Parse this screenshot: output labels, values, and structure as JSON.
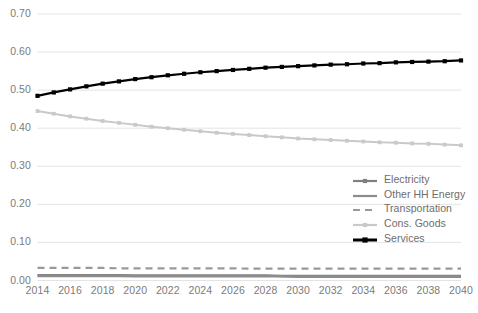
{
  "chart_data": {
    "type": "line",
    "title": "",
    "xlabel": "",
    "ylabel": "",
    "x": [
      2014,
      2015,
      2016,
      2017,
      2018,
      2019,
      2020,
      2021,
      2022,
      2023,
      2024,
      2025,
      2026,
      2027,
      2028,
      2029,
      2030,
      2031,
      2032,
      2033,
      2034,
      2035,
      2036,
      2037,
      2038,
      2039,
      2040
    ],
    "xlim": [
      2014,
      2040
    ],
    "ylim": [
      0.0,
      0.7
    ],
    "yticks": [
      0.0,
      0.1,
      0.2,
      0.3,
      0.4,
      0.5,
      0.6,
      0.7
    ],
    "ytick_labels": [
      "0.00",
      "0.10",
      "0.20",
      "0.30",
      "0.40",
      "0.50",
      "0.60",
      "0.70"
    ],
    "xticks": [
      2014,
      2016,
      2018,
      2020,
      2022,
      2024,
      2026,
      2028,
      2030,
      2032,
      2034,
      2036,
      2038,
      2040
    ],
    "xtick_labels": [
      "2014",
      "2016",
      "2018",
      "2020",
      "2022",
      "2024",
      "2026",
      "2028",
      "2030",
      "2032",
      "2034",
      "2036",
      "2038",
      "2040"
    ],
    "grid": "horizontal",
    "legend_position": "inside-right",
    "series": [
      {
        "name": "Electricity",
        "color": "#808080",
        "style": "solid-marker",
        "values": [
          0.014,
          0.014,
          0.014,
          0.014,
          0.014,
          0.014,
          0.013,
          0.013,
          0.013,
          0.013,
          0.013,
          0.013,
          0.013,
          0.013,
          0.013,
          0.012,
          0.012,
          0.012,
          0.012,
          0.012,
          0.012,
          0.012,
          0.012,
          0.012,
          0.012,
          0.012,
          0.012
        ]
      },
      {
        "name": "Other HH Energy",
        "color": "#8c8c8c",
        "style": "solid",
        "values": [
          0.012,
          0.012,
          0.012,
          0.012,
          0.012,
          0.012,
          0.011,
          0.011,
          0.011,
          0.011,
          0.011,
          0.011,
          0.011,
          0.011,
          0.011,
          0.011,
          0.01,
          0.01,
          0.01,
          0.01,
          0.01,
          0.01,
          0.01,
          0.01,
          0.01,
          0.01,
          0.01
        ]
      },
      {
        "name": "Transportation",
        "color": "#999999",
        "style": "dashed",
        "values": [
          0.033,
          0.033,
          0.033,
          0.033,
          0.033,
          0.032,
          0.032,
          0.032,
          0.032,
          0.032,
          0.032,
          0.032,
          0.032,
          0.031,
          0.031,
          0.031,
          0.031,
          0.031,
          0.031,
          0.031,
          0.031,
          0.031,
          0.031,
          0.031,
          0.031,
          0.031,
          0.031
        ]
      },
      {
        "name": "Cons. Goods",
        "color": "#c9c9c9",
        "style": "solid-marker",
        "values": [
          0.445,
          0.438,
          0.431,
          0.425,
          0.419,
          0.414,
          0.409,
          0.404,
          0.4,
          0.396,
          0.392,
          0.388,
          0.385,
          0.382,
          0.379,
          0.376,
          0.373,
          0.371,
          0.369,
          0.367,
          0.365,
          0.363,
          0.362,
          0.36,
          0.359,
          0.357,
          0.355
        ]
      },
      {
        "name": "Services",
        "color": "#000000",
        "style": "solid-marker",
        "values": [
          0.485,
          0.494,
          0.502,
          0.51,
          0.517,
          0.523,
          0.529,
          0.534,
          0.539,
          0.543,
          0.547,
          0.55,
          0.553,
          0.556,
          0.559,
          0.561,
          0.563,
          0.565,
          0.567,
          0.568,
          0.57,
          0.571,
          0.573,
          0.574,
          0.575,
          0.576,
          0.578
        ]
      }
    ]
  },
  "axes": {
    "ytick_labels": [
      "0.70",
      "0.60",
      "0.50",
      "0.40",
      "0.30",
      "0.20",
      "0.10",
      "0.00"
    ],
    "xtick_labels": [
      "2014",
      "2016",
      "2018",
      "2020",
      "2022",
      "2024",
      "2026",
      "2028",
      "2030",
      "2032",
      "2034",
      "2036",
      "2038",
      "2040"
    ]
  },
  "legend": {
    "items": [
      {
        "label": "Electricity",
        "color": "#808080",
        "style": "solid-marker"
      },
      {
        "label": "Other HH Energy",
        "color": "#8c8c8c",
        "style": "solid"
      },
      {
        "label": "Transportation",
        "color": "#999999",
        "style": "dashed"
      },
      {
        "label": "Cons. Goods",
        "color": "#c9c9c9",
        "style": "solid-marker"
      },
      {
        "label": "Services",
        "color": "#000000",
        "style": "solid-marker"
      }
    ]
  },
  "colors": {
    "grid": "#e4e4e4",
    "tick_text": "#7b7b7b",
    "legend_text": "#6d6d6d",
    "background": "#ffffff"
  }
}
